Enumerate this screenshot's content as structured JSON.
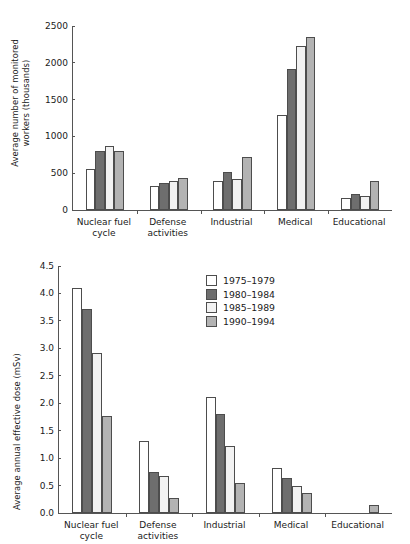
{
  "series_colors": {
    "1975-1979": "#ffffff",
    "1980-1984": "#6e6e6e",
    "1985-1989": "#f2f2f2",
    "1990-1994": "#b3b3b3"
  },
  "legend": {
    "position": "inside-top-center",
    "entries": [
      {
        "label": "1975–1979",
        "color": "#ffffff"
      },
      {
        "label": "1980–1984",
        "color": "#6e6e6e"
      },
      {
        "label": "1985–1989",
        "color": "#f2f2f2"
      },
      {
        "label": "1990–1994",
        "color": "#b3b3b3"
      }
    ]
  },
  "chart_data": [
    {
      "id": "workers",
      "type": "bar",
      "title": "",
      "xlabel": "",
      "ylabel": "Average number of monitored workers (thousands)",
      "ylabel_lines": [
        "Average number of monitored",
        "workers (thousands)"
      ],
      "ylim": [
        0,
        2500
      ],
      "yticks": [
        0,
        500,
        1000,
        1500,
        2000,
        2500
      ],
      "ytick_labels": [
        "0",
        "500",
        "1000",
        "1500",
        "2000",
        "2500"
      ],
      "grid": false,
      "legend": false,
      "categories": [
        "Nuclear fuel\ncycle",
        "Defense\nactivities",
        "Industrial",
        "Medical",
        "Educational"
      ],
      "series": [
        {
          "name": "1975–1979",
          "color": "#ffffff",
          "values": [
            555,
            320,
            400,
            1290,
            165
          ]
        },
        {
          "name": "1980–1984",
          "color": "#6e6e6e",
          "values": [
            800,
            365,
            520,
            1910,
            215
          ]
        },
        {
          "name": "1985–1989",
          "color": "#f2f2f2",
          "values": [
            875,
            395,
            415,
            2230,
            185
          ]
        },
        {
          "name": "1990–1994",
          "color": "#b3b3b3",
          "values": [
            805,
            435,
            720,
            2350,
            400
          ]
        }
      ]
    },
    {
      "id": "dose",
      "type": "bar",
      "title": "",
      "xlabel": "",
      "ylabel": "Average annual effective dose (mSv)",
      "ylabel_lines": [
        "Average annual effective dose (mSv)"
      ],
      "ylim": [
        0,
        4.5
      ],
      "yticks": [
        0,
        0.5,
        1,
        1.5,
        2,
        2.5,
        3,
        3.5,
        4,
        4.5
      ],
      "ytick_labels": [
        "0.0",
        "0.5",
        "1.0",
        "1.5",
        "2.0",
        "2.5",
        "3.0",
        "3.5",
        "4.0",
        "4.5"
      ],
      "grid": false,
      "legend": true,
      "categories": [
        "Nuclear fuel\ncycle",
        "Defense\nactivities",
        "Industrial",
        "Medical",
        "Educational"
      ],
      "series": [
        {
          "name": "1975–1979",
          "color": "#ffffff",
          "values": [
            4.1,
            1.32,
            2.12,
            0.82,
            0.0
          ]
        },
        {
          "name": "1980–1984",
          "color": "#6e6e6e",
          "values": [
            3.71,
            0.74,
            1.81,
            0.63,
            0.0
          ]
        },
        {
          "name": "1985–1989",
          "color": "#f2f2f2",
          "values": [
            2.91,
            0.68,
            1.22,
            0.5,
            0.0
          ]
        },
        {
          "name": "1990–1994",
          "color": "#b3b3b3",
          "values": [
            1.77,
            0.27,
            0.54,
            0.36,
            0.15
          ]
        }
      ]
    }
  ]
}
